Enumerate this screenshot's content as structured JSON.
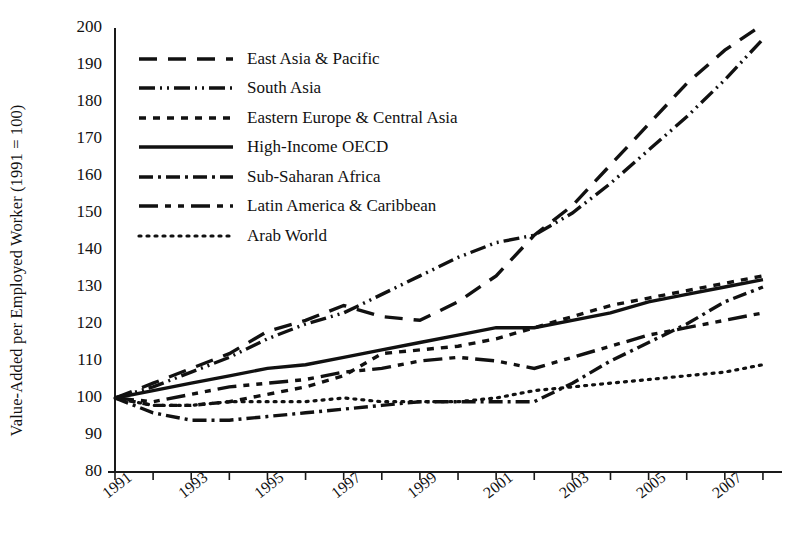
{
  "chart_data": {
    "type": "line",
    "title": "",
    "xlabel": "",
    "ylabel": "Value-Added per Employed Worker (1991 = 100)",
    "xlim": [
      1991,
      2008.5
    ],
    "ylim": [
      80,
      200
    ],
    "ytick_labels": [
      "200",
      "190",
      "180",
      "170",
      "160",
      "150",
      "140",
      "130",
      "120",
      "110",
      "100",
      "90",
      "80"
    ],
    "ytick_values": [
      200,
      190,
      180,
      170,
      160,
      150,
      140,
      130,
      120,
      110,
      100,
      90,
      80
    ],
    "xtick_labels": [
      "1991",
      "1993",
      "1995",
      "1997",
      "1999",
      "2001",
      "2003",
      "2005",
      "2007"
    ],
    "xtick_values": [
      1991,
      1993,
      1995,
      1997,
      1999,
      2001,
      2003,
      2005,
      2007
    ],
    "x": [
      1991,
      1992,
      1993,
      1994,
      1995,
      1996,
      1997,
      1998,
      1999,
      2000,
      2001,
      2002,
      2003,
      2004,
      2005,
      2006,
      2007,
      2008
    ],
    "grid": false,
    "legend_position": "upper-left-inside",
    "series": [
      {
        "name": "East Asia & Pacific",
        "dash": "18,11",
        "values": [
          100,
          104,
          108,
          112,
          118,
          121,
          125,
          122,
          121,
          126,
          133,
          144,
          152,
          163,
          174,
          185,
          194,
          201
        ]
      },
      {
        "name": "South Asia",
        "dash": "16,5,2,5,2,5",
        "values": [
          100,
          103,
          107,
          111,
          116,
          120,
          123,
          128,
          133,
          138,
          142,
          144,
          150,
          158,
          167,
          176,
          186,
          197
        ]
      },
      {
        "name": "Eastern Europe & Central Asia",
        "dash": "7,7",
        "values": [
          100,
          98,
          98,
          99,
          101,
          103,
          106,
          112,
          113,
          114,
          116,
          119,
          122,
          125,
          127,
          129,
          131,
          133
        ]
      },
      {
        "name": "High-Income OECD",
        "dash": "0",
        "values": [
          100,
          102,
          104,
          106,
          108,
          109,
          111,
          113,
          115,
          117,
          119,
          119,
          121,
          123,
          126,
          128,
          130,
          132
        ]
      },
      {
        "name": "Sub-Saharan Africa",
        "dash": "14,5,3,5",
        "values": [
          100,
          96,
          94,
          94,
          95,
          96,
          97,
          98,
          99,
          99,
          99,
          99,
          104,
          110,
          115,
          120,
          126,
          130
        ]
      },
      {
        "name": "Latin America & Caribbean",
        "dash": "19,7,6,7,6,7",
        "values": [
          100,
          99,
          101,
          103,
          104,
          105,
          107,
          108,
          110,
          111,
          110,
          108,
          111,
          114,
          117,
          119,
          121,
          123
        ]
      },
      {
        "name": "Arab World",
        "dash": "2,6",
        "values": [
          100,
          98,
          98,
          99,
          99,
          99,
          100,
          99,
          99,
          99,
          100,
          102,
          103,
          104,
          105,
          106,
          107,
          109
        ]
      }
    ]
  },
  "axis": {
    "y_title": "Value-Added per Employed Worker (1991 = 100)"
  }
}
